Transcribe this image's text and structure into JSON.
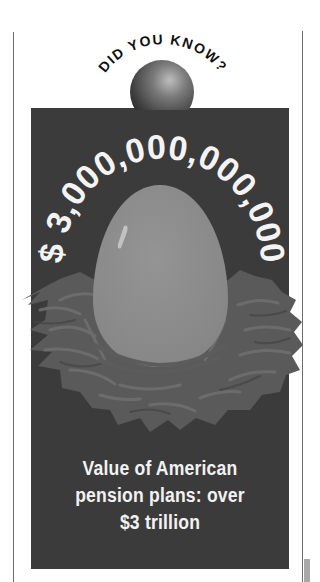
{
  "header": {
    "arc_title": "DID YOU KNOW?"
  },
  "figure": {
    "amount_arc": "$ 3,000,000,000,000",
    "icon": "nest-egg-illustration",
    "ornament": "sphere"
  },
  "caption": {
    "lines": [
      "Value of American",
      "pension plans: over",
      "$3 trillion"
    ]
  },
  "colors": {
    "panel": "#3b3b3b",
    "egg": "#8d8d8d",
    "nest": "#5e5e5e",
    "text_light": "#f2f2f2",
    "rule": "#6e6e6e"
  }
}
